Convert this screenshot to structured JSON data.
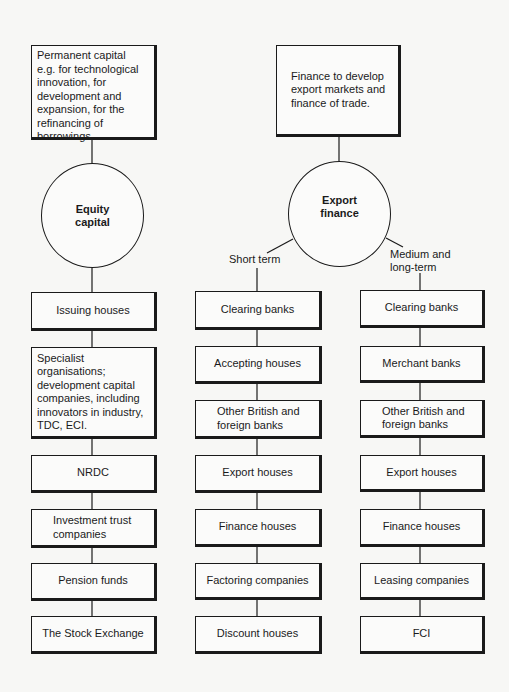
{
  "diagram": {
    "equity": {
      "description": "Permanent capital\ne.g. for technological\ninnovation, for\ndevelopment and\nexpansion, for the\nrefinancing of\nborrowings.",
      "hub": "Equity\ncapital",
      "sources": [
        "Issuing houses",
        "Specialist organisations;\ndevelopment capital\ncompanies, including\ninnovators in industry,\nTDC, ECI.",
        "NRDC",
        "Investment trust\ncompanies",
        "Pension funds",
        "The Stock Exchange"
      ]
    },
    "export": {
      "description": "Finance to develop\nexport markets and\nfinance of trade.",
      "hub": "Export\nfinance",
      "short_term": {
        "label": "Short term",
        "sources": [
          "Clearing banks",
          "Accepting houses",
          "Other British and\nforeign banks",
          "Export houses",
          "Finance houses",
          "Factoring companies",
          "Discount houses"
        ]
      },
      "medium_long_term": {
        "label": "Medium and\nlong-term",
        "sources": [
          "Clearing banks",
          "Merchant banks",
          "Other British and\nforeign banks",
          "Export houses",
          "Finance houses",
          "Leasing companies",
          "FCI"
        ]
      }
    }
  }
}
